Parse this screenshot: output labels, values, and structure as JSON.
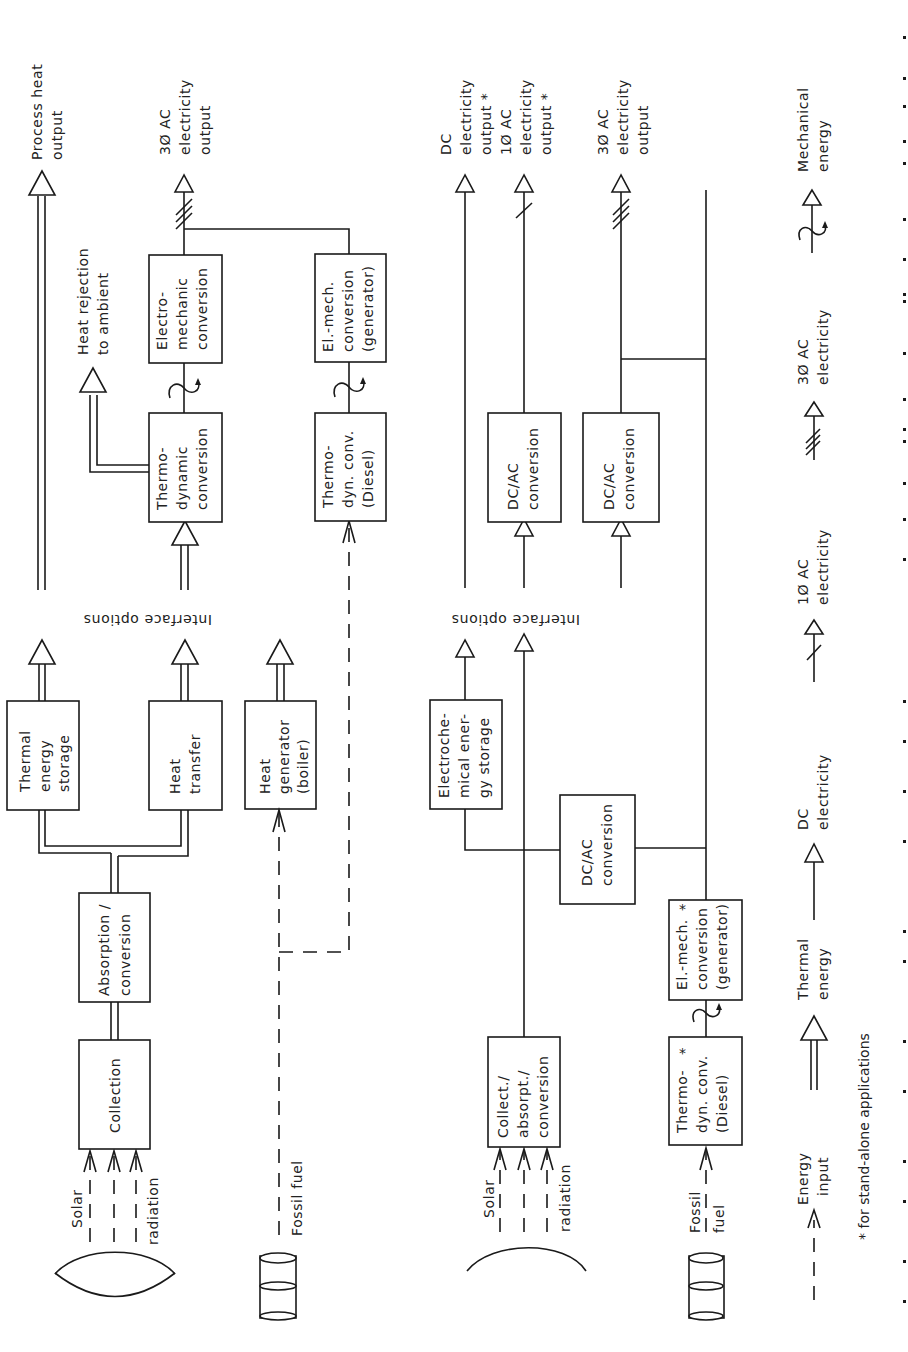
{
  "figure": {
    "orientation": "rotated 90 degrees counter-clockwise",
    "footnote": "* for stand-alone applications",
    "caption_visible_fragment": ""
  },
  "thermal_system": {
    "sources": {
      "solar": {
        "line1": "Solar",
        "line2": "radiation"
      },
      "fossil": {
        "label": "Fossil fuel"
      }
    },
    "blocks": {
      "collection": [
        "Collection"
      ],
      "absorption": [
        "Absorption /",
        "conversion"
      ],
      "thermal_storage": [
        "Thermal",
        "energy",
        "storage"
      ],
      "heat_transfer": [
        "Heat",
        "transfer"
      ],
      "heat_generator": [
        "Heat",
        "generator",
        "(boiler)"
      ],
      "thermodynamic": [
        "Thermo-",
        "dynamic",
        "conversion"
      ],
      "electromechanic": [
        "Electro-",
        "mechanic",
        "conversion"
      ],
      "thermodyn_diesel": [
        "Thermo-",
        "dyn. conv.",
        "(Diesel)"
      ],
      "elmech_generator": [
        "El.-mech.",
        "conversion",
        "(generator)"
      ]
    },
    "interface_label": "Interface options",
    "outputs": {
      "process_heat": [
        "Process heat",
        "output"
      ],
      "heat_rejection": [
        "Heat rejection",
        "to ambient"
      ],
      "ac3_output": [
        "3Ø AC",
        "electricity",
        "output"
      ]
    }
  },
  "electric_system": {
    "sources": {
      "solar": {
        "line1": "Solar",
        "line2": "radiation"
      },
      "fossil": {
        "line1": "Fossil",
        "line2": "fuel"
      }
    },
    "blocks": {
      "collect_absorpt": [
        "Collect./",
        "absorpt./",
        "conversion"
      ],
      "electrochemical": [
        "Electroche-",
        "mical ener-",
        "gy storage"
      ],
      "dcac_main": [
        "DC/AC",
        "conversion"
      ],
      "thermodyn_diesel": [
        "Thermo-",
        "dyn. conv.",
        "(Diesel)"
      ],
      "thermodyn_diesel_mark": "*",
      "elmech_generator": [
        "El.-mech.",
        "conversion",
        "(generator)"
      ],
      "elmech_generator_mark": "*",
      "dcac_1": [
        "DC/AC",
        "conversion"
      ],
      "dcac_2": [
        "DC/AC",
        "conversion"
      ]
    },
    "interface_label": "Interface options",
    "outputs": {
      "dc_output": [
        "DC",
        "electricity",
        "output  *"
      ],
      "ac1_output": [
        "1Ø AC",
        "electricity",
        "output  *"
      ],
      "ac3_output": [
        "3Ø AC",
        "electricity",
        "output"
      ]
    }
  },
  "legend": [
    {
      "symbol": "energy-input",
      "lines": [
        "Energy",
        "input"
      ]
    },
    {
      "symbol": "thermal-energy",
      "lines": [
        "Thermal",
        "energy"
      ]
    },
    {
      "symbol": "dc-electricity",
      "lines": [
        "DC",
        "electricity"
      ]
    },
    {
      "symbol": "ac1-electricity",
      "lines": [
        "1Ø AC",
        "electricity"
      ]
    },
    {
      "symbol": "ac3-electricity",
      "lines": [
        "3Ø AC",
        "electricity"
      ]
    },
    {
      "symbol": "mechanical-energy",
      "lines": [
        "Mechanical",
        "energy"
      ]
    }
  ]
}
